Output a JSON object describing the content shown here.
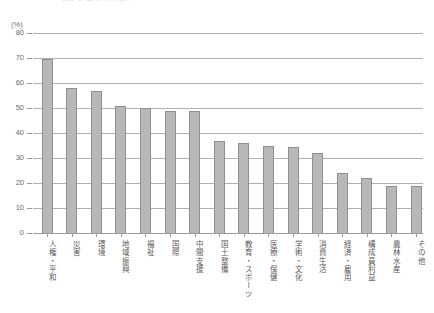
{
  "title": "図1  活動分野別割合",
  "axis": {
    "unit_label": "(%)",
    "y_ticks": [
      "80",
      "70",
      "60",
      "50",
      "40",
      "30",
      "20",
      "10",
      "0"
    ]
  },
  "chart_data": {
    "type": "bar",
    "title": "図1  活動分野別割合",
    "xlabel": "",
    "ylabel": "(%)",
    "ylim": [
      0,
      80
    ],
    "ytick_step": 10,
    "grid": true,
    "legend": "none",
    "bar_color": "#b8b8b8",
    "bar_edge_color": "#8f8f8f",
    "categories": [
      "人権・平和",
      "災害",
      "環境",
      "地域振興",
      "福祉",
      "国際",
      "中間支援",
      "国土整備",
      "教育・スポーツ",
      "医療・保健",
      "学術・文化",
      "消費生活",
      "経済・雇用",
      "構成員利益",
      "農林水産",
      "その他"
    ],
    "values": [
      69.5,
      58,
      57,
      51,
      50,
      49,
      49,
      37,
      36,
      35,
      34.5,
      32,
      24,
      22,
      19,
      19
    ]
  }
}
